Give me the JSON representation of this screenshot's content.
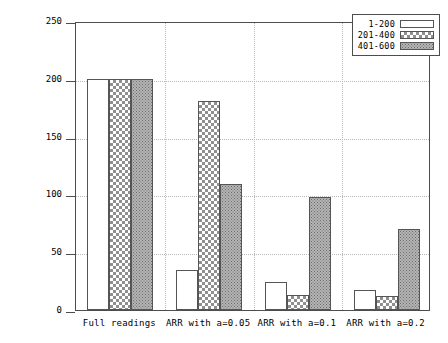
{
  "chart_data": {
    "type": "bar",
    "title": "",
    "xlabel": "",
    "ylabel": "Number of packet transmission",
    "categories": [
      "Full readings",
      "ARR with a=0.05",
      "ARR with a=0.1",
      "ARR with a=0.2"
    ],
    "series": [
      {
        "name": "1-200",
        "values": [
          200,
          35,
          24,
          17
        ]
      },
      {
        "name": "201-400",
        "values": [
          200,
          181,
          13,
          12
        ]
      },
      {
        "name": "401-600",
        "values": [
          200,
          109,
          98,
          70
        ]
      }
    ],
    "ylim": [
      0,
      250
    ],
    "yticks": [
      0,
      50,
      100,
      150,
      200,
      250
    ],
    "ytick_labels": [
      "0",
      "50",
      "100",
      "150",
      "200",
      "250"
    ],
    "grid": true,
    "legend_position": "top-right",
    "patterns": [
      "empty",
      "checkerboard",
      "stipple"
    ],
    "colors": {
      "axis": "#4d4d4d",
      "grid": "#b9b9b9",
      "bar_border": "#555555",
      "series_1": "#ffffff",
      "series_2": "#8f8f8f",
      "series_3": "#b5b5b5",
      "background": "#ffffff"
    }
  }
}
